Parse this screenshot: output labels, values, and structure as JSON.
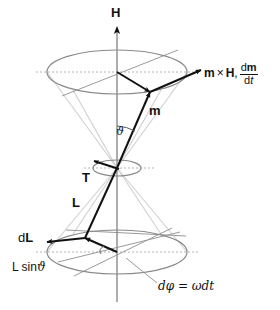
{
  "figure": {
    "background_color": "#ffffff",
    "stroke_dark": "#111111",
    "stroke_gray": "#9a9a9a",
    "stroke_light": "#cfcfcf"
  },
  "labels": {
    "field_axis": "H",
    "moment_vector": "m",
    "torque_vector": "T",
    "angular_momentum_vector": "L",
    "dL_prefix": "d",
    "dL_vector": "L",
    "projection_prefix": "L sin",
    "projection_angle": "ϑ",
    "cone_angle": "ϑ",
    "rotation_annotation": "dφ = ωdt",
    "cross_product": {
      "first": "m",
      "operator": "×",
      "second": "H",
      "separator": ",",
      "numerator_d": "d",
      "numerator_var": "m",
      "denominator_d": "d",
      "denominator_var": "t"
    }
  },
  "geometry": {
    "axis": {
      "x": 117,
      "top_y": 28,
      "bottom_y": 302
    },
    "apex": {
      "x": 117,
      "y": 168
    },
    "top_ellipse": {
      "cx": 117,
      "cy": 72,
      "rx": 70,
      "ry": 22
    },
    "mid_ellipse": {
      "cx": 117,
      "cy": 168,
      "rx": 24,
      "ry": 8
    },
    "bottom_ellipse": {
      "cx": 117,
      "cy": 252,
      "rx": 70,
      "ry": 22
    },
    "m_tip": {
      "x": 150,
      "y": 92
    },
    "L_tip": {
      "x": 85,
      "y": 238
    },
    "T_tip": {
      "x": 95,
      "y": 162
    },
    "dL_tip": {
      "x": 46,
      "y": 241
    },
    "mxh_tip": {
      "x": 199,
      "y": 70
    }
  }
}
